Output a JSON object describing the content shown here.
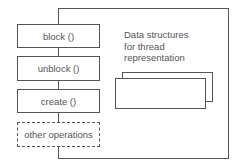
{
  "diagram": {
    "operations": [
      {
        "label": "block ()",
        "style": "solid"
      },
      {
        "label": "unblock ()",
        "style": "solid"
      },
      {
        "label": "create ()",
        "style": "solid"
      },
      {
        "label": "other operations",
        "style": "dashed"
      }
    ],
    "data_label": {
      "line1": "Data structures",
      "line2": "for thread",
      "line3": "representation"
    },
    "line_color": "#555555"
  }
}
